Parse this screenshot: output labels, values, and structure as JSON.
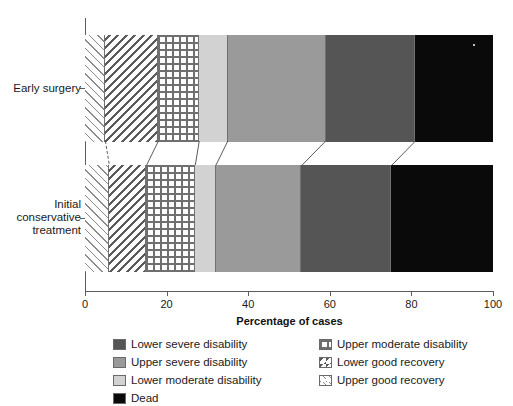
{
  "chart_data": {
    "type": "bar",
    "orientation": "horizontal",
    "stacked": true,
    "percent": true,
    "title": "",
    "xlabel": "Percentage of cases",
    "ylabel": "",
    "xlim": [
      0,
      100
    ],
    "xticks": [
      0,
      20,
      40,
      60,
      80,
      100
    ],
    "xtick_labels": [
      "0",
      "20",
      "40",
      "60",
      "80",
      "100"
    ],
    "grid": false,
    "legend_position": "bottom",
    "categories": [
      "Early surgery",
      "Initial conservative treatment"
    ],
    "series": [
      {
        "name": "Upper good recovery",
        "key": "upper-good",
        "color": "#fdfdfd",
        "pattern": "diagonal-hatch-up",
        "values": [
          5,
          6
        ]
      },
      {
        "name": "Lower good recovery",
        "key": "lower-good",
        "color": "#fdfdfd",
        "pattern": "diagonal-hatch-down",
        "values": [
          13,
          9
        ]
      },
      {
        "name": "Upper moderate disability",
        "key": "upper-mod",
        "color": "#fdfdfd",
        "pattern": "dotted-grid",
        "values": [
          10,
          12
        ]
      },
      {
        "name": "Lower moderate disability",
        "key": "lower-mod",
        "color": "#d2d2d2",
        "pattern": "solid",
        "values": [
          7,
          5
        ]
      },
      {
        "name": "Upper severe disability",
        "key": "upper-sev",
        "color": "#9a9a9a",
        "pattern": "solid",
        "values": [
          24,
          21
        ]
      },
      {
        "name": "Lower severe disability",
        "key": "lower-sev",
        "color": "#555555",
        "pattern": "solid",
        "values": [
          22,
          22
        ]
      },
      {
        "name": "Dead",
        "key": "dead",
        "color": "#0a0a0a",
        "pattern": "solid",
        "values": [
          19,
          25
        ]
      }
    ],
    "cumulative_boundaries": {
      "Early surgery": [
        0,
        5,
        18,
        28,
        35,
        59,
        81,
        100
      ],
      "Initial conservative treatment": [
        0,
        6,
        15,
        27,
        32,
        53,
        75,
        100
      ]
    }
  },
  "axis": {
    "x_title": "Percentage of cases",
    "x_tick_labels": [
      "0",
      "20",
      "40",
      "60",
      "80",
      "100"
    ],
    "y_tick_labels": [
      "Early surgery",
      "Initial\nconservative\ntreatment"
    ]
  },
  "legend": {
    "left_column": [
      {
        "label": "Lower severe disability"
      },
      {
        "label": "Upper severe disability"
      },
      {
        "label": "Lower moderate disability"
      },
      {
        "label": "Dead"
      }
    ],
    "right_column": [
      {
        "label": "Upper moderate disability"
      },
      {
        "label": "Lower good recovery"
      },
      {
        "label": "Upper good recovery"
      }
    ]
  },
  "colors": {
    "lower_severe": "#555555",
    "upper_severe": "#9a9a9a",
    "lower_moderate": "#d2d2d2",
    "dead": "#0a0a0a",
    "axis": "#5c5c5c",
    "text": "#1a1a1a"
  }
}
